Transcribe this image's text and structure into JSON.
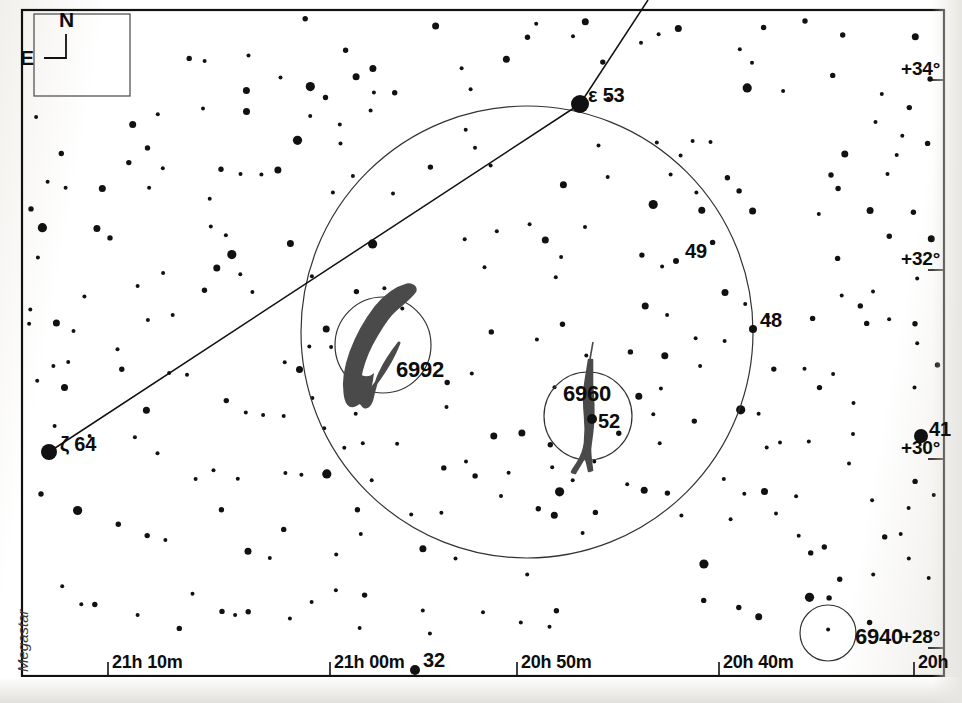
{
  "chart_data": {
    "type": "scatter",
    "subtitle": "",
    "xlabel": "Right Ascension",
    "ylabel": "Declination",
    "grid": false,
    "legend_position": "none",
    "source_label": "Megastar",
    "xlim": [
      "21h 15m",
      "20h 37m"
    ],
    "ylim": [
      "+27.5",
      "+34.8"
    ],
    "ra_ticks": [
      {
        "label": "21h 10m",
        "x": 108
      },
      {
        "label": "21h 00m",
        "x": 330
      },
      {
        "label": "20h 50m",
        "x": 517
      },
      {
        "label": "20h 40m",
        "x": 719
      },
      {
        "label": "20h",
        "x": 914
      }
    ],
    "dec_ticks": [
      {
        "label": "+34°",
        "y": 80
      },
      {
        "label": "+32°",
        "y": 270
      },
      {
        "label": "+30°",
        "y": 459
      },
      {
        "label": "+28°",
        "y": 648
      }
    ],
    "deep_sky_objects": [
      {
        "name": "6992",
        "type": "nebula",
        "common": "Eastern Veil Nebula",
        "cx": 383,
        "cy": 345,
        "r": 48,
        "label_x": 396,
        "label_y": 357
      },
      {
        "name": "6960",
        "type": "nebula",
        "common": "Western Veil Nebula",
        "cx": 588,
        "cy": 416,
        "r": 44,
        "label_x": 563,
        "label_y": 381
      },
      {
        "name": "6940",
        "type": "open-cluster",
        "common": "",
        "cx": 828,
        "cy": 633,
        "r": 28,
        "label_x": 855,
        "label_y": 624
      }
    ],
    "field_circle": {
      "cx": 527,
      "cy": 332,
      "r": 226
    },
    "named_stars": [
      {
        "label": "ε 53",
        "bayer": "ε",
        "flamsteed": "53",
        "x": 580,
        "y": 104,
        "mag_px": 9,
        "label_x": 588,
        "label_y": 84
      },
      {
        "label": "ζ 64",
        "bayer": "ζ",
        "flamsteed": "64",
        "x": 49,
        "y": 452,
        "mag_px": 8,
        "label_x": 60,
        "label_y": 433
      },
      {
        "label": "49",
        "bayer": "",
        "flamsteed": "49",
        "x": 676,
        "y": 261,
        "mag_px": 3,
        "label_x": 685,
        "label_y": 240
      },
      {
        "label": "48",
        "bayer": "",
        "flamsteed": "48",
        "x": 753,
        "y": 329,
        "mag_px": 4,
        "label_x": 760,
        "label_y": 309
      },
      {
        "label": "41",
        "bayer": "",
        "flamsteed": "41",
        "x": 921,
        "y": 436,
        "mag_px": 7,
        "label_x": 929,
        "label_y": 418
      },
      {
        "label": "52",
        "bayer": "",
        "flamsteed": "52",
        "x": 592,
        "y": 419,
        "mag_px": 5,
        "label_x": 598,
        "label_y": 410
      },
      {
        "label": "32",
        "bayer": "",
        "flamsteed": "32",
        "x": 415,
        "y": 670,
        "mag_px": 5,
        "label_x": 423,
        "label_y": 649
      }
    ],
    "constellation_lines": [
      {
        "from": "ζ 64",
        "to": "ε 53",
        "x1": 49,
        "y1": 452,
        "x2": 580,
        "y2": 104
      },
      {
        "from": "ε 53",
        "to": "off-chart-north",
        "x1": 580,
        "y1": 104,
        "x2": 648,
        "y2": 0
      }
    ],
    "star_count": 300
  },
  "compass": {
    "north_label": "N",
    "east_label": "E"
  },
  "watermark": {
    "text": "Megastar"
  },
  "colors": {
    "ink": "#111111",
    "paper": "#ffffff",
    "nebula_fill": "#4a4a4a",
    "circle_stroke": "#333333"
  }
}
